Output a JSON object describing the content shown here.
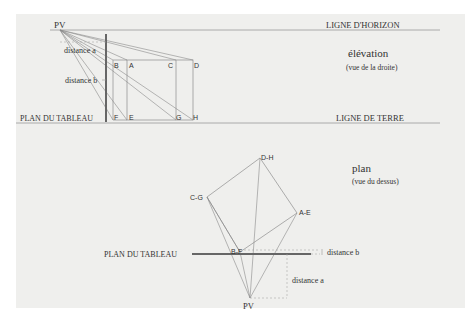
{
  "elevation": {
    "title": "élévation",
    "subtitle": "(vue de la droite)",
    "horizon_label": "LIGNE D'HORIZON",
    "ground_label": "LIGNE DE TERRE",
    "picture_plane_label": "PLAN DU TABLEAU",
    "viewpoint_label": "PV",
    "distance_a_label": "distance a",
    "distance_b_label": "distance b",
    "points": [
      "B",
      "A",
      "C",
      "D",
      "F",
      "E",
      "G",
      "H"
    ]
  },
  "plan": {
    "title": "plan",
    "subtitle": "(vue du dessus)",
    "picture_plane_label": "PLAN DU TABLEAU",
    "viewpoint_label": "PV",
    "distance_a_label": "distance a",
    "distance_b_label": "distance b",
    "points": [
      "D-H",
      "C-G",
      "A-E",
      "B-F"
    ]
  },
  "colors": {
    "background": "#efefed",
    "line": "#8a8a8a",
    "bar": "#666666",
    "text": "#333333"
  }
}
